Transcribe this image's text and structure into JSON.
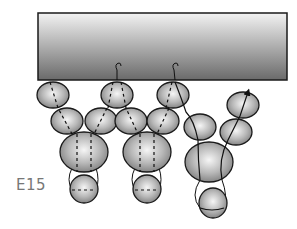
{
  "figure": {
    "label": "E15",
    "colors": {
      "bar_top": "#f2f2f2",
      "bar_bottom": "#6a6a6a",
      "bead_light": "#f4f4f4",
      "bead_dark": "#7d7d7d",
      "outline": "#1a1a1a",
      "label": "#777777"
    },
    "bar": {
      "x": 38,
      "y": 13,
      "width": 249,
      "height": 67
    },
    "beads": [
      {
        "id": "top-1",
        "cx": 53,
        "cy": 95,
        "rx": 16,
        "ry": 13
      },
      {
        "id": "top-2",
        "cx": 117,
        "cy": 95,
        "rx": 16,
        "ry": 13
      },
      {
        "id": "top-3",
        "cx": 173,
        "cy": 95,
        "rx": 16,
        "ry": 13
      },
      {
        "id": "mid-1",
        "cx": 67,
        "cy": 121,
        "rx": 16,
        "ry": 13
      },
      {
        "id": "mid-2",
        "cx": 101,
        "cy": 121,
        "rx": 16,
        "ry": 13
      },
      {
        "id": "mid-3",
        "cx": 131,
        "cy": 121,
        "rx": 16,
        "ry": 13
      },
      {
        "id": "mid-4",
        "cx": 163,
        "cy": 121,
        "rx": 16,
        "ry": 13
      },
      {
        "id": "big-1",
        "cx": 84,
        "cy": 152,
        "rx": 24,
        "ry": 20
      },
      {
        "id": "big-2",
        "cx": 147,
        "cy": 152,
        "rx": 24,
        "ry": 20
      },
      {
        "id": "drop-1",
        "cx": 84,
        "cy": 189,
        "rx": 14,
        "ry": 14
      },
      {
        "id": "drop-2",
        "cx": 147,
        "cy": 189,
        "rx": 14,
        "ry": 14
      },
      {
        "id": "right-a",
        "cx": 200,
        "cy": 127,
        "rx": 16,
        "ry": 13
      },
      {
        "id": "right-big",
        "cx": 209,
        "cy": 162,
        "rx": 24,
        "ry": 20
      },
      {
        "id": "right-drop",
        "cx": 213,
        "cy": 203,
        "rx": 14,
        "ry": 15
      },
      {
        "id": "right-b",
        "cx": 236,
        "cy": 132,
        "rx": 16,
        "ry": 13
      },
      {
        "id": "right-c",
        "cx": 243,
        "cy": 105,
        "rx": 16,
        "ry": 13
      }
    ]
  }
}
